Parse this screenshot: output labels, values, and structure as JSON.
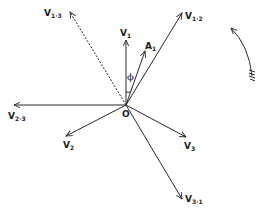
{
  "diagram": {
    "type": "phasor-diagram",
    "origin": {
      "label": "O",
      "x": 126,
      "y": 105
    },
    "vectors": [
      {
        "id": "V1",
        "main": "V",
        "sub": "1",
        "x2": 126,
        "y2": 40,
        "lx": 120,
        "ly": 36,
        "style": "solid"
      },
      {
        "id": "A1",
        "main": "A",
        "sub": "1",
        "x2": 145,
        "y2": 51,
        "lx": 145,
        "ly": 49,
        "style": "solid"
      },
      {
        "id": "V1-2",
        "main": "V",
        "sub": "1·2",
        "x2": 182,
        "y2": 13,
        "lx": 185,
        "ly": 19,
        "style": "solid"
      },
      {
        "id": "V1-3",
        "main": "V",
        "sub": "1·3",
        "x2": 70,
        "y2": 12,
        "lx": 44,
        "ly": 16,
        "style": "dashed"
      },
      {
        "id": "V2-3",
        "main": "V",
        "sub": "2·3",
        "x2": 14,
        "y2": 105,
        "lx": 8,
        "ly": 119,
        "style": "solid"
      },
      {
        "id": "V2",
        "main": "V",
        "sub": "2",
        "x2": 66,
        "y2": 136,
        "lx": 63,
        "ly": 148,
        "style": "solid"
      },
      {
        "id": "V3",
        "main": "V",
        "sub": "3",
        "x2": 186,
        "y2": 137,
        "lx": 184,
        "ly": 149,
        "style": "solid"
      },
      {
        "id": "V3-1",
        "main": "V",
        "sub": "3·1",
        "x2": 182,
        "y2": 199,
        "lx": 185,
        "ly": 202,
        "style": "solid"
      }
    ],
    "angle": {
      "label": "ϕ",
      "between": [
        "V1",
        "A1"
      ],
      "lx": 127,
      "ly": 80
    },
    "rotation_indicator": {
      "direction": "counter-clockwise",
      "icon": "curved-arrow-icon"
    }
  }
}
